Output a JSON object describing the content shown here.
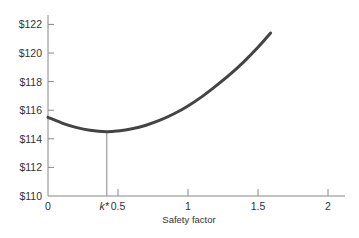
{
  "chart_data": {
    "type": "line",
    "title": "",
    "xlabel": "Safety factor",
    "ylabel": "",
    "xlim": [
      0,
      2.1
    ],
    "ylim": [
      110,
      123
    ],
    "x_ticks": [
      0,
      0.5,
      1,
      1.5,
      2
    ],
    "x_tick_labels": [
      "0",
      "0.5",
      "1",
      "1.5",
      "2"
    ],
    "y_ticks": [
      110,
      112,
      114,
      116,
      118,
      120,
      122
    ],
    "y_tick_labels": [
      "$110",
      "$112",
      "$114",
      "$116",
      "$118",
      "$120",
      "$122"
    ],
    "grid": false,
    "legend": null,
    "series": [
      {
        "name": "Total cost",
        "x": [
          0,
          0.1,
          0.2,
          0.3,
          0.42,
          0.5,
          0.6,
          0.7,
          0.8,
          0.9,
          1.0,
          1.1,
          1.2,
          1.3,
          1.4,
          1.5,
          1.59
        ],
        "y": [
          115.5,
          115.1,
          114.8,
          114.6,
          114.5,
          114.55,
          114.7,
          114.95,
          115.3,
          115.75,
          116.3,
          116.95,
          117.7,
          118.5,
          119.4,
          120.4,
          121.4
        ]
      }
    ],
    "annotations": [
      {
        "type": "vline",
        "x": 0.42,
        "from_y": 110,
        "to_y": 114.5,
        "label": "k*"
      }
    ]
  },
  "labels": {
    "kstar": "k*",
    "xlabel": "Safety factor"
  }
}
